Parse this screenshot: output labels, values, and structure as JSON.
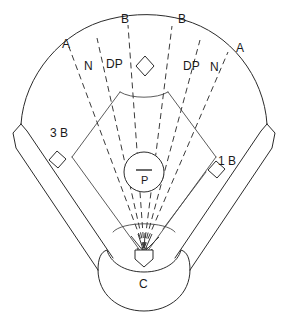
{
  "diagram": {
    "line_color": "#2b2b2b",
    "dash_color": "#3a3a3a",
    "background": "#ffffff"
  },
  "labels": {
    "b_left": "B",
    "b_right": "B",
    "a_left": "A",
    "a_right": "A",
    "n_left": "N",
    "n_right": "N",
    "dp_left": "DP",
    "dp_right": "DP",
    "third_base": "3 B",
    "first_base": "1 B",
    "pitcher": "P",
    "catcher": "C"
  },
  "positions": {
    "b_left": {
      "x": 121,
      "y": 13
    },
    "b_right": {
      "x": 178,
      "y": 13
    },
    "a_left": {
      "x": 62,
      "y": 38
    },
    "a_right": {
      "x": 236,
      "y": 42
    },
    "n_left": {
      "x": 84,
      "y": 60
    },
    "n_right": {
      "x": 210,
      "y": 61
    },
    "dp_left": {
      "x": 106,
      "y": 58
    },
    "dp_right": {
      "x": 183,
      "y": 60
    },
    "third_base": {
      "x": 50,
      "y": 127
    },
    "first_base": {
      "x": 218,
      "y": 155
    },
    "pitcher": {
      "x": 141,
      "y": 178
    },
    "catcher": {
      "x": 142,
      "y": 281
    }
  },
  "geometry": {
    "home_plate": {
      "x": 144,
      "y": 256
    },
    "second_base": {
      "x": 145,
      "y": 66
    },
    "first_base_bag": {
      "x": 216,
      "y": 170
    },
    "third_base_bag": {
      "x": 57,
      "y": 160
    },
    "mound_center": {
      "x": 144,
      "y": 172
    },
    "mound_radius": 20,
    "outfield_arc_label": "outfield fence arc"
  }
}
